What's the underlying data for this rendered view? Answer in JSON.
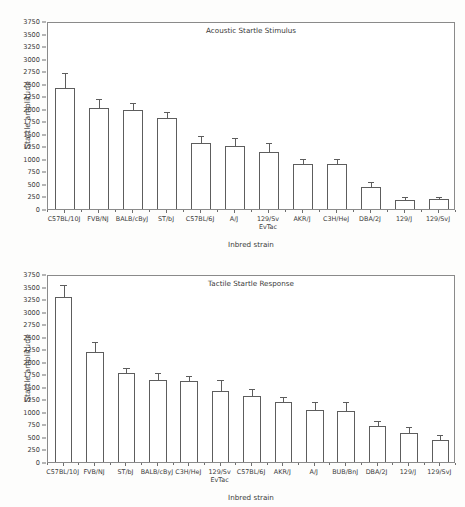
{
  "figure": {
    "ylabel": "Startle amplitude",
    "xlabel": "Inbred strain"
  },
  "chart_data": [
    {
      "type": "bar",
      "title": "Acoustic Startle Stimulus",
      "xlabel": "Inbred strain",
      "ylabel": "Startle amplitude",
      "ylim": [
        0,
        3750
      ],
      "ytick_step": 250,
      "yticks": [
        0,
        250,
        500,
        750,
        1000,
        1250,
        1500,
        1750,
        2000,
        2250,
        2500,
        2750,
        3000,
        3250,
        3500,
        3750
      ],
      "ytick_labels": [
        "0",
        "250",
        "500",
        "750",
        "1000",
        "1250",
        "1500",
        "1750",
        "2000",
        "2250",
        "2500",
        "2750",
        "3000",
        "3250",
        "3500",
        "3750"
      ],
      "grid": false,
      "legend": "none",
      "categories": [
        "C57BL/10J",
        "FVB/NJ",
        "BALB/cByJ",
        "ST/bJ",
        "C57BL/6J",
        "A/J",
        "129/Sv EvTac",
        "AKR/J",
        "C3H/HeJ",
        "DBA/2J",
        "129/J",
        "129/SvJ"
      ],
      "category_lines": [
        [
          "C57BL/10J"
        ],
        [
          "FVB/NJ"
        ],
        [
          "BALB/cByJ"
        ],
        [
          "ST/bJ"
        ],
        [
          "C57BL/6J"
        ],
        [
          "A/J"
        ],
        [
          "129/Sv",
          "EvTac"
        ],
        [
          "AKR/J"
        ],
        [
          "C3H/HeJ"
        ],
        [
          "DBA/2J"
        ],
        [
          "129/J"
        ],
        [
          "129/SvJ"
        ]
      ],
      "values": [
        2410,
        2010,
        1980,
        1820,
        1320,
        1250,
        1140,
        890,
        895,
        430,
        185,
        190
      ],
      "errors": [
        280,
        155,
        110,
        105,
        110,
        145,
        150,
        85,
        80,
        80,
        25,
        20
      ]
    },
    {
      "type": "bar",
      "title": "Tactile Startle Response",
      "xlabel": "Inbred strain",
      "ylabel": "Startle amplitude",
      "ylim": [
        0,
        3750
      ],
      "ytick_step": 250,
      "yticks": [
        0,
        250,
        500,
        750,
        1000,
        1250,
        1500,
        1750,
        2000,
        2250,
        2500,
        2750,
        3000,
        3250,
        3500,
        3750
      ],
      "ytick_labels": [
        "0",
        "250",
        "500",
        "750",
        "1000",
        "1250",
        "1500",
        "1750",
        "2000",
        "2250",
        "2500",
        "2750",
        "3000",
        "3250",
        "3500",
        "3750"
      ],
      "grid": false,
      "legend": "none",
      "categories": [
        "C57BL/10J",
        "FVB/NJ",
        "ST/bJ",
        "BALB/cByJ",
        "C3H/HeJ",
        "129/Sv EvTac",
        "C57BL/6J",
        "AKR/J",
        "A/J",
        "BUB/BnJ",
        "DBA/2J",
        "129/J",
        "129/SvJ"
      ],
      "category_lines": [
        [
          "C57BL/10J"
        ],
        [
          "FVB/NJ"
        ],
        [
          "ST/bJ"
        ],
        [
          "BALB/cByJ"
        ],
        [
          "C3H/HeJ"
        ],
        [
          "129/Sv",
          "EvTac"
        ],
        [
          "C57BL/6J"
        ],
        [
          "AKR/J"
        ],
        [
          "A/J"
        ],
        [
          "BUB/BnJ"
        ],
        [
          "DBA/2J"
        ],
        [
          "129/J"
        ],
        [
          "129/SvJ"
        ]
      ],
      "values": [
        3290,
        2190,
        1770,
        1635,
        1615,
        1415,
        1320,
        1190,
        1040,
        1025,
        710,
        570,
        430
      ],
      "errors": [
        230,
        180,
        90,
        125,
        85,
        195,
        115,
        90,
        130,
        145,
        85,
        115,
        80
      ]
    }
  ]
}
